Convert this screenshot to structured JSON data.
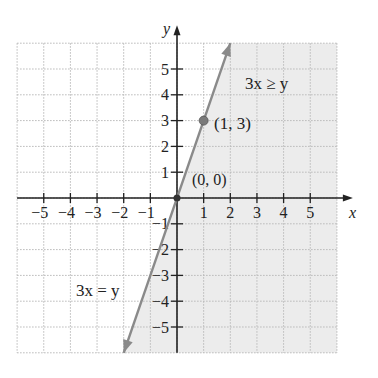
{
  "chart_data": {
    "type": "line",
    "title": "",
    "xlabel": "x",
    "ylabel": "y",
    "xlim": [
      -6,
      6
    ],
    "ylim": [
      -6,
      6
    ],
    "grid": true,
    "x_ticks": [
      -5,
      -4,
      -3,
      -2,
      -1,
      1,
      2,
      3,
      4,
      5
    ],
    "y_ticks": [
      -5,
      -4,
      -3,
      -2,
      -1,
      1,
      2,
      3,
      4,
      5
    ],
    "x_tick_labels": [
      "−5",
      "−4",
      "−3",
      "−2",
      "−1",
      "1",
      "2",
      "3",
      "4",
      "5"
    ],
    "y_tick_labels": [
      "−5",
      "−4",
      "−3",
      "−2",
      "−1",
      "1",
      "2",
      "3",
      "4",
      "5"
    ],
    "series": [
      {
        "name": "3x = y",
        "equation": "y = 3x",
        "x": [
          -2,
          2
        ],
        "y": [
          -6,
          6
        ],
        "style": "solid with arrows"
      }
    ],
    "shaded_region": {
      "inequality": "3x ≥ y",
      "description": "region to the right of / below the line y = 3x"
    },
    "points": [
      {
        "label": "(1, 3)",
        "x": 1,
        "y": 3
      },
      {
        "label": "(0, 0)",
        "x": 0,
        "y": 0
      }
    ],
    "annotations": [
      {
        "text": "3x ≥ y",
        "x": 3,
        "y": 4.4
      },
      {
        "text": "3x = y",
        "x": -3.6,
        "y": -3.5
      }
    ]
  },
  "labels": {
    "x_axis": "x",
    "y_axis": "y",
    "inequality": "3x ≥ y",
    "boundary": "3x = y",
    "point_a": "(1, 3)",
    "point_origin": "(0, 0)"
  },
  "colors": {
    "shade": "#ececec",
    "grid": "#b8b8b8",
    "axis": "#222222",
    "line": "#8a8a8a",
    "point": "#7a7a7a"
  }
}
